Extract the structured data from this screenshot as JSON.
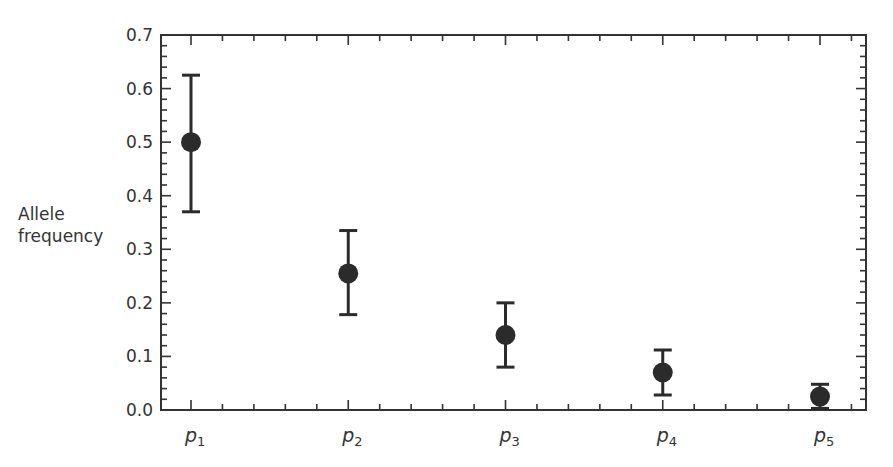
{
  "chart_data": {
    "type": "scatter",
    "title": "",
    "xlabel": "",
    "ylabel": "Allele frequency",
    "ylabel_lines": [
      "Allele",
      "frequency"
    ],
    "categories": [
      "p1",
      "p2",
      "p3",
      "p4",
      "p5"
    ],
    "category_labels": [
      {
        "base": "p",
        "sub": "1"
      },
      {
        "base": "p",
        "sub": "2"
      },
      {
        "base": "p",
        "sub": "3"
      },
      {
        "base": "p",
        "sub": "4"
      },
      {
        "base": "p",
        "sub": "5"
      }
    ],
    "series": [
      {
        "name": "Allele frequency",
        "values": [
          0.5,
          0.255,
          0.14,
          0.07,
          0.025
        ],
        "error_low": [
          0.37,
          0.178,
          0.08,
          0.028,
          0.003
        ],
        "error_high": [
          0.625,
          0.335,
          0.2,
          0.112,
          0.048
        ]
      }
    ],
    "ylim": [
      0.0,
      0.7
    ],
    "yticks": [
      "0.0",
      "0.1",
      "0.2",
      "0.3",
      "0.4",
      "0.5",
      "0.6",
      "0.7"
    ],
    "grid": false,
    "legend": null,
    "colors": {
      "marker": "#2b2b2b",
      "axis": "#333333",
      "text": "#333333"
    }
  }
}
